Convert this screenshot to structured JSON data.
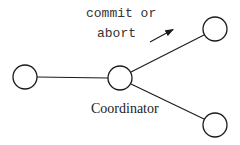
{
  "diagram": {
    "nodes": [
      {
        "id": "participant-left",
        "cx": 25,
        "cy": 77,
        "r": 12
      },
      {
        "id": "coordinator",
        "cx": 120,
        "cy": 78,
        "r": 12
      },
      {
        "id": "participant-top-right",
        "cx": 215,
        "cy": 29,
        "r": 12
      },
      {
        "id": "participant-bottom-right",
        "cx": 215,
        "cy": 125,
        "r": 12
      }
    ],
    "edges": [
      {
        "from": "participant-left",
        "to": "coordinator"
      },
      {
        "from": "coordinator",
        "to": "participant-top-right"
      },
      {
        "from": "coordinator",
        "to": "participant-bottom-right"
      }
    ],
    "labels": {
      "message_line1": "commit or",
      "message_line2": "abort",
      "coordinator": "Coordinator"
    },
    "arrow": {
      "x1": 150,
      "y1": 42,
      "x2": 174,
      "y2": 29,
      "meaning": "message-direction"
    },
    "colors": {
      "stroke": "#1a1a1a",
      "background": "#ffffff"
    }
  }
}
